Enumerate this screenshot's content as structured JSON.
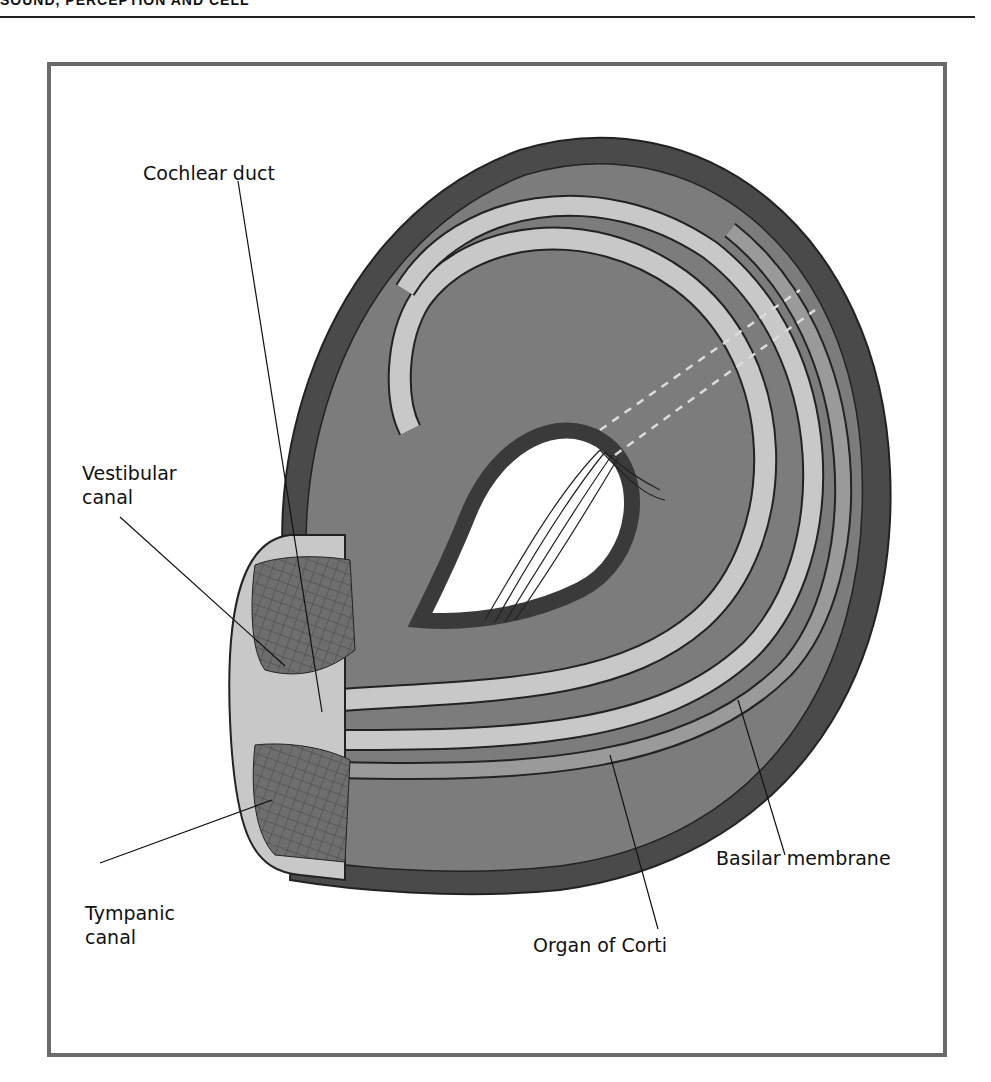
{
  "header": {
    "running_head": "SOUND, PERCEPTION AND CELL"
  },
  "figure": {
    "labels": {
      "cochlear_duct": "Cochlear duct",
      "vestibular_canal_line1": "Vestibular",
      "vestibular_canal_line2": "canal",
      "tympanic_canal_line1": "Tympanic",
      "tympanic_canal_line2": "canal",
      "organ_of_corti": "Organ of Corti",
      "basilar_membrane": "Basilar membrane"
    },
    "colors": {
      "outer_wall": "#4a4a4a",
      "fill": "#7c7c7c",
      "membrane_light": "#c8c8c8",
      "membrane_mid": "#9a9a9a",
      "frame": "#6a6a6a"
    }
  }
}
